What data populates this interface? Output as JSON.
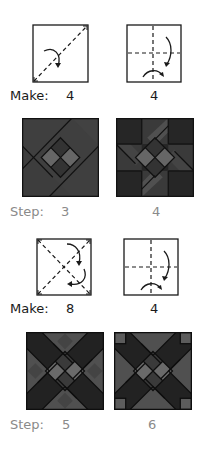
{
  "sections": [
    {
      "fold_row": {
        "label": "Make:",
        "diagrams": [
          {
            "type": "diagonal-fold",
            "quantity": "4"
          },
          {
            "type": "cross-fold",
            "quantity": "4"
          }
        ]
      },
      "block_row": {
        "label": "Step:",
        "blocks": [
          {
            "step": "3"
          },
          {
            "step": "4"
          }
        ]
      }
    },
    {
      "fold_row": {
        "label": "Make:",
        "diagrams": [
          {
            "type": "double-diagonal-fold",
            "quantity": "8"
          },
          {
            "type": "cross-fold",
            "quantity": "4"
          }
        ]
      },
      "block_row": {
        "label": "Step:",
        "blocks": [
          {
            "step": "5"
          },
          {
            "step": "6"
          }
        ]
      }
    }
  ],
  "colors": {
    "line": "#1a1a1a",
    "make_text": "#1a1a1a",
    "step_text": "#8a8a8a",
    "dark": "#2a2a2a",
    "mid": "#3f3f3f",
    "medium": "#4c4c4c",
    "light": "#6a6a6a",
    "lighter": "#5a5a5a"
  }
}
